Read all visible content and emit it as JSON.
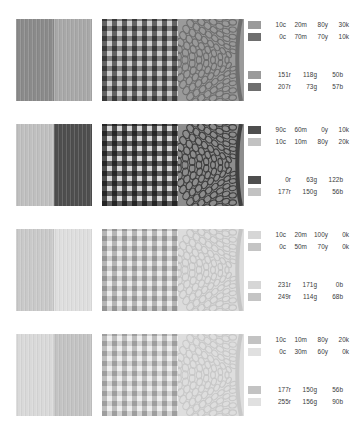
{
  "document": {
    "title": "Colorway Swatch Sheet",
    "background": "#ffffff",
    "text_color": "#3a3a3a"
  },
  "pattern_types": [
    "vertical-stripe",
    "gingham-check",
    "damask-paisley"
  ],
  "rows": [
    {
      "name": "colorway-1",
      "patterns": {
        "stripe": {
          "left_color": "#8a8a8a",
          "right_color": "#a8a8a8"
        },
        "check": {
          "light_color": "#b8b8b8",
          "dark_color": "#7d7d7d",
          "bg_color": "#cfcfcf"
        },
        "damask": {
          "ground_color": "#9a9a9a",
          "motif_color": "#6e6e6e"
        }
      },
      "cmyk": [
        {
          "chip": "#9a9a9a",
          "c": "10c",
          "m": "20m",
          "y": "80y",
          "k": "30k"
        },
        {
          "chip": "#6e6e6e",
          "c": "0c",
          "m": "70m",
          "y": "70y",
          "k": "10k"
        }
      ],
      "rgb": [
        {
          "chip": "#9a9a9a",
          "r": "151r",
          "g": "118g",
          "b": "50b"
        },
        {
          "chip": "#6e6e6e",
          "r": "207r",
          "g": "73g",
          "b": "57b"
        }
      ]
    },
    {
      "name": "colorway-2",
      "patterns": {
        "stripe": {
          "left_color": "#bfbfbf",
          "right_color": "#4e4e4e"
        },
        "check": {
          "light_color": "#c2c2c2",
          "dark_color": "#555555",
          "bg_color": "#d8d8d8"
        },
        "damask": {
          "ground_color": "#8d8d8d",
          "motif_color": "#3f3f3f"
        }
      },
      "cmyk": [
        {
          "chip": "#4e4e4e",
          "c": "90c",
          "m": "60m",
          "y": "0y",
          "k": "10k"
        },
        {
          "chip": "#c2c2c2",
          "c": "10c",
          "m": "10m",
          "y": "80y",
          "k": "20k"
        }
      ],
      "rgb": [
        {
          "chip": "#4e4e4e",
          "r": "0r",
          "g": "63g",
          "b": "122b"
        },
        {
          "chip": "#c2c2c2",
          "r": "177r",
          "g": "150g",
          "b": "56b"
        }
      ]
    },
    {
      "name": "colorway-3",
      "patterns": {
        "stripe": {
          "left_color": "#c9c9c9",
          "right_color": "#dedede"
        },
        "check": {
          "light_color": "#e0e0e0",
          "dark_color": "#cacaca",
          "bg_color": "#ededed"
        },
        "damask": {
          "ground_color": "#dcdcdc",
          "motif_color": "#c4c4c4"
        }
      },
      "cmyk": [
        {
          "chip": "#d6d6d6",
          "c": "10c",
          "m": "20m",
          "y": "100y",
          "k": "0k"
        },
        {
          "chip": "#c4c4c4",
          "c": "0c",
          "m": "50m",
          "y": "70y",
          "k": "0k"
        }
      ],
      "rgb": [
        {
          "chip": "#d6d6d6",
          "r": "231r",
          "g": "171g",
          "b": "0b"
        },
        {
          "chip": "#c4c4c4",
          "r": "249r",
          "g": "114g",
          "b": "68b"
        }
      ]
    },
    {
      "name": "colorway-4",
      "patterns": {
        "stripe": {
          "left_color": "#d9d9d9",
          "right_color": "#c3c3c3"
        },
        "check": {
          "light_color": "#e4e4e4",
          "dark_color": "#d0d0d0",
          "bg_color": "#efefef"
        },
        "damask": {
          "ground_color": "#dedede",
          "motif_color": "#c8c8c8"
        }
      },
      "cmyk": [
        {
          "chip": "#c3c3c3",
          "c": "10c",
          "m": "10m",
          "y": "80y",
          "k": "20k"
        },
        {
          "chip": "#e0e0e0",
          "c": "0c",
          "m": "30m",
          "y": "60y",
          "k": "0k"
        }
      ],
      "rgb": [
        {
          "chip": "#c3c3c3",
          "r": "177r",
          "g": "150g",
          "b": "56b"
        },
        {
          "chip": "#e0e0e0",
          "r": "255r",
          "g": "156g",
          "b": "90b"
        }
      ]
    }
  ]
}
